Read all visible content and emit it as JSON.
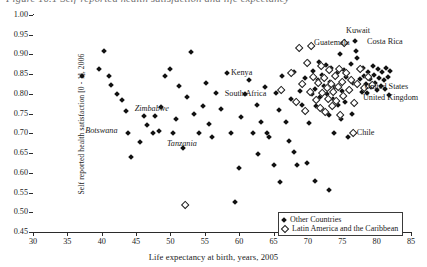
{
  "figure": {
    "caption_partial": "Figure 10.1  Self-reported health satisfaction and life expectancy"
  },
  "legend": {
    "position": "bottom-right",
    "entries": [
      {
        "label": "Other Countries",
        "marker": "filled-diamond"
      },
      {
        "label": "Latin America and the Caribbean",
        "marker": "open-diamond"
      }
    ]
  },
  "chart_data": {
    "type": "scatter",
    "title": "",
    "xlabel": "Life expectancy at birth, years, 2005",
    "ylabel": "Self reported health satisfaction [0 - 1], 2006",
    "xlim": [
      30,
      85
    ],
    "ylim": [
      0.45,
      1.0
    ],
    "xticks": [
      30,
      35,
      40,
      45,
      50,
      55,
      60,
      65,
      70,
      75,
      80,
      85
    ],
    "yticks": [
      0.45,
      0.5,
      0.55,
      0.6,
      0.65,
      0.7,
      0.75,
      0.8,
      0.85,
      0.9,
      0.95,
      1.0
    ],
    "grid": false,
    "series": [
      {
        "name": "Other Countries",
        "marker": "filled-diamond",
        "points": [
          [
            37.2,
            0.845
          ],
          [
            39.6,
            0.862
          ],
          [
            40.4,
            0.908
          ],
          [
            41.0,
            0.845
          ],
          [
            41.4,
            0.822
          ],
          [
            42.2,
            0.8
          ],
          [
            43.0,
            0.785
          ],
          [
            43.6,
            0.756
          ],
          [
            43.8,
            0.7
          ],
          [
            44.2,
            0.64
          ],
          [
            45.6,
            0.678
          ],
          [
            46.2,
            0.745
          ],
          [
            46.6,
            0.722
          ],
          [
            47.4,
            0.7
          ],
          [
            47.8,
            0.745
          ],
          [
            48.4,
            0.706
          ],
          [
            48.6,
            0.768
          ],
          [
            49.2,
            0.846
          ],
          [
            50.0,
            0.862
          ],
          [
            50.4,
            0.7
          ],
          [
            50.8,
            0.736
          ],
          [
            51.2,
            0.82
          ],
          [
            51.8,
            0.662
          ],
          [
            52.4,
            0.792
          ],
          [
            53.0,
            0.905
          ],
          [
            53.4,
            0.748
          ],
          [
            54.2,
            0.7
          ],
          [
            54.8,
            0.77
          ],
          [
            55.2,
            0.828
          ],
          [
            55.6,
            0.724
          ],
          [
            56.0,
            0.69
          ],
          [
            56.6,
            0.802
          ],
          [
            57.4,
            0.762
          ],
          [
            58.2,
            0.854
          ],
          [
            58.8,
            0.7
          ],
          [
            59.4,
            0.525
          ],
          [
            60.2,
            0.742
          ],
          [
            60.8,
            0.8
          ],
          [
            61.4,
            0.836
          ],
          [
            62.0,
            0.7
          ],
          [
            62.6,
            0.772
          ],
          [
            63.2,
            0.728
          ],
          [
            63.8,
            0.818
          ],
          [
            64.4,
            0.69
          ],
          [
            65.0,
            0.62
          ],
          [
            65.4,
            0.802
          ],
          [
            65.8,
            0.76
          ],
          [
            66.2,
            0.846
          ],
          [
            66.8,
            0.73
          ],
          [
            67.2,
            0.68
          ],
          [
            67.6,
            0.788
          ],
          [
            68.0,
            0.856
          ],
          [
            68.4,
            0.62
          ],
          [
            68.8,
            0.808
          ],
          [
            69.2,
            0.772
          ],
          [
            69.6,
            0.84
          ],
          [
            70.0,
            0.88
          ],
          [
            70.2,
            0.726
          ],
          [
            70.6,
            0.8
          ],
          [
            70.8,
            0.858
          ],
          [
            71.0,
            0.812
          ],
          [
            71.2,
            0.77
          ],
          [
            71.4,
            0.836
          ],
          [
            71.6,
            0.88
          ],
          [
            71.8,
            0.792
          ],
          [
            72.0,
            0.848
          ],
          [
            72.2,
            0.76
          ],
          [
            72.4,
            0.82
          ],
          [
            72.6,
            0.874
          ],
          [
            72.8,
            0.8
          ],
          [
            73.0,
            0.746
          ],
          [
            73.2,
            0.83
          ],
          [
            73.4,
            0.866
          ],
          [
            73.6,
            0.788
          ],
          [
            73.8,
            0.7
          ],
          [
            74.0,
            0.818
          ],
          [
            74.2,
            0.854
          ],
          [
            74.4,
            0.772
          ],
          [
            74.6,
            0.902
          ],
          [
            74.8,
            0.736
          ],
          [
            75.0,
            0.808
          ],
          [
            75.2,
            0.86
          ],
          [
            75.4,
            0.78
          ],
          [
            75.6,
            0.842
          ],
          [
            75.8,
            0.69
          ],
          [
            76.0,
            0.812
          ],
          [
            76.2,
            0.876
          ],
          [
            76.4,
            0.748
          ],
          [
            76.6,
            0.828
          ],
          [
            76.8,
            0.934
          ],
          [
            77.0,
            0.908
          ],
          [
            77.2,
            0.89
          ],
          [
            77.4,
            0.862
          ],
          [
            77.6,
            0.838
          ],
          [
            77.8,
            0.804
          ],
          [
            78.0,
            0.866
          ],
          [
            78.2,
            0.846
          ],
          [
            78.4,
            0.824
          ],
          [
            78.6,
            0.802
          ],
          [
            78.8,
            0.856
          ],
          [
            79.0,
            0.838
          ],
          [
            79.2,
            0.818
          ],
          [
            79.4,
            0.872
          ],
          [
            79.6,
            0.848
          ],
          [
            79.8,
            0.828
          ],
          [
            80.0,
            0.81
          ],
          [
            80.2,
            0.862
          ],
          [
            80.4,
            0.84
          ],
          [
            80.6,
            0.82
          ],
          [
            80.8,
            0.856
          ],
          [
            81.0,
            0.834
          ],
          [
            81.2,
            0.812
          ],
          [
            81.4,
            0.866
          ],
          [
            81.6,
            0.844
          ],
          [
            81.8,
            0.798
          ],
          [
            82.0,
            0.858
          ],
          [
            69.8,
            0.626
          ],
          [
            71.0,
            0.58
          ],
          [
            73.0,
            0.556
          ],
          [
            66.0,
            0.576
          ],
          [
            68.0,
            0.654
          ],
          [
            64.0,
            0.7
          ],
          [
            62.8,
            0.648
          ],
          [
            60.0,
            0.612
          ]
        ]
      },
      {
        "name": "Latin America and the Caribbean",
        "marker": "open-diamond",
        "points": [
          [
            52.0,
            0.52
          ],
          [
            66.0,
            0.812
          ],
          [
            67.4,
            0.856
          ],
          [
            68.2,
            0.782
          ],
          [
            69.0,
            0.826
          ],
          [
            69.4,
            0.76
          ],
          [
            69.8,
            0.88
          ],
          [
            70.2,
            0.808
          ],
          [
            70.6,
            0.846
          ],
          [
            71.0,
            0.786
          ],
          [
            71.4,
            0.83
          ],
          [
            71.6,
            0.766
          ],
          [
            71.8,
            0.872
          ],
          [
            72.0,
            0.804
          ],
          [
            72.2,
            0.842
          ],
          [
            72.4,
            0.756
          ],
          [
            72.6,
            0.818
          ],
          [
            72.8,
            0.79
          ],
          [
            73.0,
            0.862
          ],
          [
            73.2,
            0.826
          ],
          [
            73.4,
            0.772
          ],
          [
            73.6,
            0.808
          ],
          [
            73.8,
            0.848
          ],
          [
            74.0,
            0.784
          ],
          [
            74.2,
            0.82
          ],
          [
            74.4,
            0.864
          ],
          [
            74.6,
            0.748
          ],
          [
            74.8,
            0.832
          ],
          [
            75.0,
            0.796
          ],
          [
            75.4,
            0.854
          ],
          [
            75.8,
            0.812
          ],
          [
            76.2,
            0.838
          ],
          [
            76.6,
            0.78
          ],
          [
            77.0,
            0.828
          ],
          [
            77.4,
            0.864
          ],
          [
            78.0,
            0.816
          ],
          [
            78.6,
            0.846
          ],
          [
            79.2,
            0.824
          ],
          [
            76.4,
            0.702
          ],
          [
            70.4,
            0.924
          ],
          [
            75.2,
            0.93
          ],
          [
            68.6,
            0.918
          ]
        ]
      }
    ],
    "annotations": [
      {
        "label": "Kuwait",
        "x": 77.3,
        "y": 0.96,
        "align": "center"
      },
      {
        "label": "Costa Rica",
        "x": 78.6,
        "y": 0.932,
        "align": "left"
      },
      {
        "label": "Guatemala",
        "x": 70.9,
        "y": 0.928,
        "align": "left"
      },
      {
        "label": "United States",
        "x": 78.2,
        "y": 0.818,
        "align": "left"
      },
      {
        "label": "United Kingdom",
        "x": 78.0,
        "y": 0.79,
        "align": "left"
      },
      {
        "label": "Chile",
        "x": 77.1,
        "y": 0.7,
        "align": "left"
      },
      {
        "label": "Kenya",
        "x": 58.8,
        "y": 0.852,
        "align": "left"
      },
      {
        "label": "South Africa",
        "x": 57.9,
        "y": 0.8,
        "align": "left"
      },
      {
        "label": "Zimbabwe",
        "x": 44.8,
        "y": 0.762,
        "align": "left"
      },
      {
        "label": "Botswana",
        "x": 37.6,
        "y": 0.706,
        "align": "left"
      },
      {
        "label": "Tanzania",
        "x": 49.5,
        "y": 0.672,
        "align": "left"
      }
    ]
  }
}
